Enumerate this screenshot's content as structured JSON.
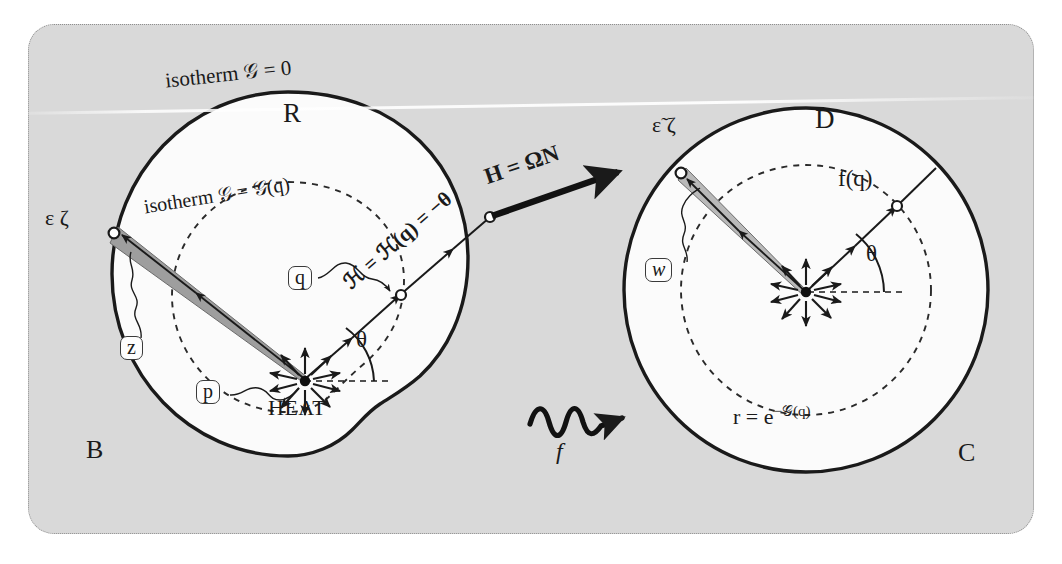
{
  "figure": {
    "caption_ghost": "",
    "background_color": "#d9d9d9",
    "page_color": "#ffffff",
    "ink_color": "#1a1a1a",
    "shade_color": "#9a9a9a"
  },
  "left_region": {
    "outer_label": "B",
    "inner_label": "R",
    "boundary_isotherm": "isotherm 𝒢 = 0",
    "inner_isotherm": "isotherm 𝒢 = 𝒢(q)",
    "source_label": "HEAT",
    "angle_label": "θ",
    "flux_label": "H = ΩN",
    "ray_label": "ℋ = ℋ(q) = −θ",
    "boundary_point_label": "ε ζ",
    "tube_label": "z",
    "center_label": "p",
    "point_label": "q"
  },
  "right_region": {
    "outer_label": "C",
    "inner_label": "D",
    "image_point_label": "f(q)",
    "angle_label": "θ",
    "radius_label": "r = e−𝒢(q)",
    "radius_label_parts": {
      "lead": "r = e",
      "exp": "−𝒢(q)"
    },
    "boundary_point_label": "ε̃ ζ",
    "tube_label": "w"
  },
  "map_arrow": {
    "label": "f",
    "style": "squiggly-arrow"
  },
  "icons": {
    "heat_source": "radial-burst-icon",
    "map_arrow": "squiggly-arrow-icon",
    "flux_arrow": "bold-arrow-icon"
  }
}
